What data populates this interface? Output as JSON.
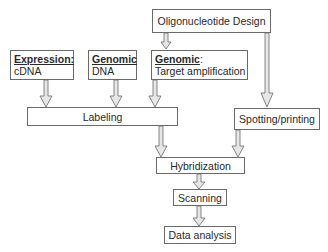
{
  "diagram": {
    "type": "flowchart",
    "nodes": [
      {
        "id": "oligo",
        "label": "Oligonucleotide Design"
      },
      {
        "id": "expr",
        "heading": "Expression:",
        "label": "cDNA"
      },
      {
        "id": "gdna",
        "heading": "Genomic",
        "label": "DNA"
      },
      {
        "id": "gtarget",
        "heading": "Genomic",
        "heading_suffix": ":",
        "label": "Target amplification"
      },
      {
        "id": "labeling",
        "label": "Labeling"
      },
      {
        "id": "spotting",
        "label": "Spotting/printing"
      },
      {
        "id": "hyb",
        "label": "Hybridization"
      },
      {
        "id": "scan",
        "label": "Scanning"
      },
      {
        "id": "analysis",
        "label": "Data analysis"
      }
    ],
    "edges": [
      [
        "oligo",
        "gtarget"
      ],
      [
        "oligo",
        "spotting"
      ],
      [
        "expr",
        "labeling"
      ],
      [
        "gdna",
        "labeling"
      ],
      [
        "gtarget",
        "labeling"
      ],
      [
        "labeling",
        "hyb"
      ],
      [
        "spotting",
        "hyb"
      ],
      [
        "hyb",
        "scan"
      ],
      [
        "scan",
        "analysis"
      ]
    ],
    "colors": {
      "border": "#6a6a6a",
      "arrow_fill": "#e6e6e6",
      "arrow_stroke": "#6a6a6a"
    }
  }
}
